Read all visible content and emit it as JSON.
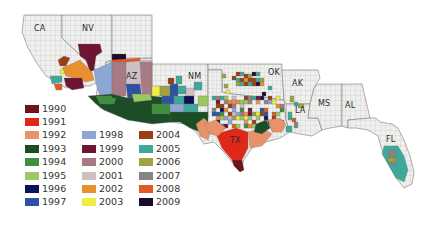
{
  "map": {
    "title": "",
    "region": "Southern United States counties",
    "state_labels": [
      {
        "abbr": "CA"
      },
      {
        "abbr": "NV"
      },
      {
        "abbr": "AZ"
      },
      {
        "abbr": "NM"
      },
      {
        "abbr": "OK"
      },
      {
        "abbr": "AK"
      },
      {
        "abbr": "LA"
      },
      {
        "abbr": "MS"
      },
      {
        "abbr": "AL"
      },
      {
        "abbr": "TX"
      },
      {
        "abbr": "FL"
      }
    ],
    "no_data_color": "#efefed",
    "border_color": "#9a9a9a"
  },
  "legend": {
    "columns": [
      [
        {
          "year": "1990",
          "color": "#6e1416"
        },
        {
          "year": "1991",
          "color": "#e02818"
        },
        {
          "year": "1992",
          "color": "#e8926a"
        },
        {
          "year": "1993",
          "color": "#1d4d26"
        },
        {
          "year": "1994",
          "color": "#3f8f3c"
        },
        {
          "year": "1995",
          "color": "#9cc862"
        },
        {
          "year": "1996",
          "color": "#0c1458"
        },
        {
          "year": "1997",
          "color": "#2f52a0"
        }
      ],
      [
        {
          "year": "1998",
          "color": "#8ea6d6"
        },
        {
          "year": "1999",
          "color": "#6e1532"
        },
        {
          "year": "2000",
          "color": "#a87a84"
        },
        {
          "year": "2001",
          "color": "#cdbfc2"
        },
        {
          "year": "2002",
          "color": "#e8902e"
        },
        {
          "year": "2003",
          "color": "#eeee44"
        }
      ],
      [
        {
          "year": "2004",
          "color": "#9a3e16"
        },
        {
          "year": "2005",
          "color": "#3fa898"
        },
        {
          "year": "2006",
          "color": "#a2a240"
        },
        {
          "year": "2007",
          "color": "#858585"
        },
        {
          "year": "2008",
          "color": "#e25a22"
        },
        {
          "year": "2009",
          "color": "#1c0a2c"
        }
      ]
    ]
  }
}
